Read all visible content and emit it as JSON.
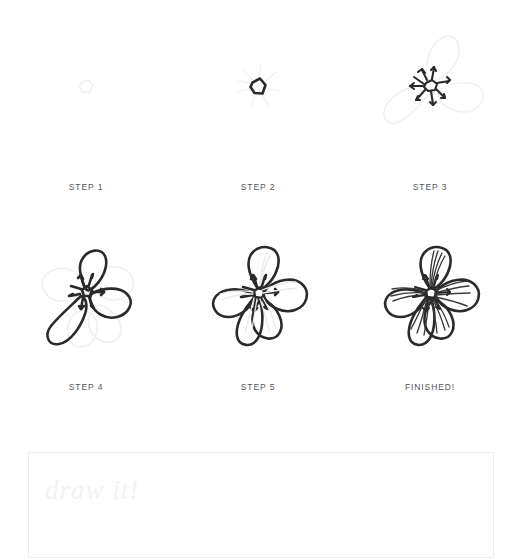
{
  "page": {
    "background_color": "#ffffff",
    "ink_color": "#2a2a2c",
    "guide_color": "#f0f0f1",
    "label_color": "#53565a",
    "box_border_color": "#eceded"
  },
  "steps": [
    {
      "id": "step-1",
      "label": "STEP 1",
      "stage": "faint-pentagon-center-guide"
    },
    {
      "id": "step-2",
      "label": "STEP 2",
      "stage": "inked-pentagon-center-with-faint-stamens"
    },
    {
      "id": "step-3",
      "label": "STEP 3",
      "stage": "inked-center-stamens-with-faint-petal-guides"
    },
    {
      "id": "step-4",
      "label": "STEP 4",
      "stage": "three-petals-inked-over-guides"
    },
    {
      "id": "step-5",
      "label": "STEP 5",
      "stage": "all-five-petals-inked-faint-veins"
    },
    {
      "id": "step-6",
      "label": "FINISHED!",
      "stage": "complete-flower-with-inked-veins"
    }
  ],
  "practice": {
    "prompt": "draw it!"
  }
}
